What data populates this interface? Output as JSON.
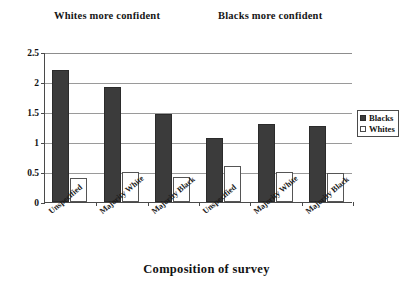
{
  "captions": {
    "left": "Whites more confident",
    "right": "Blacks more confident"
  },
  "legend": {
    "items": [
      {
        "label": "Blacks",
        "color": "#3b3b3b"
      },
      {
        "label": "Whites",
        "color": "#ffffff"
      }
    ]
  },
  "axis_title": "Composition of survey",
  "chart_data": {
    "type": "bar",
    "title": "",
    "xlabel": "Composition of survey",
    "ylabel": "",
    "ylim": [
      0,
      2.5
    ],
    "yticks": [
      0,
      0.5,
      1,
      1.5,
      2,
      2.5
    ],
    "ytick_labels": [
      "0",
      "0.5",
      "1",
      "1.5",
      "2",
      "2.5"
    ],
    "grid": true,
    "legend_position": "right",
    "categories": [
      "Unspecified",
      "Majority White",
      "Majority Black",
      "Unspecified",
      "Majority White",
      "Majority Black"
    ],
    "group_annotations": [
      {
        "label": "Whites more confident",
        "categories": [
          0,
          1,
          2
        ]
      },
      {
        "label": "Blacks more confident",
        "categories": [
          3,
          4,
          5
        ]
      }
    ],
    "series": [
      {
        "name": "Blacks",
        "color": "#3b3b3b",
        "values": [
          2.2,
          1.92,
          1.47,
          1.07,
          1.3,
          1.27
        ]
      },
      {
        "name": "Whites",
        "color": "#ffffff",
        "values": [
          0.4,
          0.5,
          0.42,
          0.6,
          0.5,
          0.48
        ]
      }
    ]
  }
}
